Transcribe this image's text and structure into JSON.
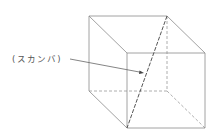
{
  "diagram": {
    "type": "cube-wireframe",
    "label": "(スカンバ)",
    "colors": {
      "edges": "#8a8a8a",
      "diagonal": "#555555",
      "text": "#555555"
    },
    "vertices": {
      "back_top_left": [
        89,
        16
      ],
      "back_top_right": [
        167,
        16
      ],
      "back_bottom_left": [
        89,
        91
      ],
      "back_bottom_right": [
        167,
        91
      ],
      "front_top_left": [
        127,
        53
      ],
      "front_top_right": [
        205,
        53
      ],
      "front_bottom_left": [
        127,
        128
      ],
      "front_bottom_right": [
        205,
        128
      ]
    },
    "leader": {
      "from": [
        70,
        59
      ],
      "to": [
        143,
        73
      ]
    }
  }
}
